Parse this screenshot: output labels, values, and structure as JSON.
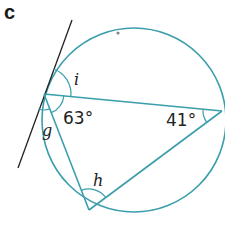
{
  "part_label": "c",
  "colors": {
    "circle": "#3a9eab",
    "chords": "#3a9eab",
    "tangent": "#222222",
    "arcs": "#3a9eab",
    "text": "#222222"
  },
  "circle": {
    "cx": 134,
    "cy": 120,
    "r": 92
  },
  "points": {
    "A": {
      "x": 44,
      "y": 94
    },
    "B": {
      "x": 222,
      "y": 111
    },
    "C": {
      "x": 89,
      "y": 210
    }
  },
  "tangent": {
    "x1": 72,
    "y1": 20,
    "x2": 18,
    "y2": 168
  },
  "labels": {
    "i": "i",
    "angle_A": "63°",
    "g": "g",
    "angle_B": "41°",
    "h": "h"
  }
}
